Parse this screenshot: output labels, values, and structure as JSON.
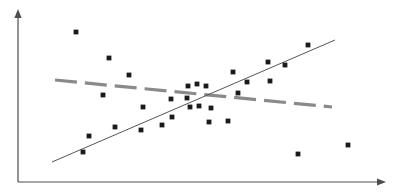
{
  "figure": {
    "width": 399,
    "height": 195,
    "background_color": "#ffffff",
    "title": "",
    "alt_description": "Scatter plot with an upward solid regression line and a downward dashed gray line"
  },
  "colors": {
    "axis": "#4d4d4d",
    "point": "#1a1a1a",
    "solid_line": "#555555",
    "dashed_line": "#8a8a8a",
    "background": "#ffffff"
  },
  "axes": {
    "origin": {
      "x": 18,
      "y": 182
    },
    "y_axis": {
      "x": 18,
      "y_top": 13,
      "y_bottom": 182,
      "arrow": "up-arrow",
      "label": "",
      "ticks": []
    },
    "x_axis": {
      "y": 182,
      "x_left": 18,
      "x_right": 382,
      "arrow": "right-arrow",
      "label": "",
      "ticks": []
    },
    "stroke_width": 1.2,
    "arrow_size": 5
  },
  "chart_data": {
    "type": "scatter",
    "title": "",
    "xlabel": "",
    "ylabel": "",
    "xlim": [
      18,
      382
    ],
    "ylim": [
      13,
      182
    ],
    "grid": false,
    "legend": "none",
    "axis_ticks_visible": false,
    "point_marker": "square",
    "point_size": 2.4,
    "points": [
      {
        "x": 76,
        "y": 32
      },
      {
        "x": 109,
        "y": 58
      },
      {
        "x": 129,
        "y": 75
      },
      {
        "x": 103,
        "y": 95
      },
      {
        "x": 143,
        "y": 107
      },
      {
        "x": 171,
        "y": 99
      },
      {
        "x": 172,
        "y": 117
      },
      {
        "x": 115,
        "y": 127
      },
      {
        "x": 141,
        "y": 130
      },
      {
        "x": 162,
        "y": 125
      },
      {
        "x": 89,
        "y": 136
      },
      {
        "x": 83,
        "y": 152
      },
      {
        "x": 188,
        "y": 86
      },
      {
        "x": 197,
        "y": 84
      },
      {
        "x": 206,
        "y": 86
      },
      {
        "x": 187,
        "y": 98
      },
      {
        "x": 190,
        "y": 107
      },
      {
        "x": 199,
        "y": 106
      },
      {
        "x": 211,
        "y": 108
      },
      {
        "x": 209,
        "y": 122
      },
      {
        "x": 228,
        "y": 121
      },
      {
        "x": 233,
        "y": 72
      },
      {
        "x": 247,
        "y": 82
      },
      {
        "x": 238,
        "y": 93
      },
      {
        "x": 268,
        "y": 62
      },
      {
        "x": 270,
        "y": 81
      },
      {
        "x": 285,
        "y": 65
      },
      {
        "x": 308,
        "y": 45
      },
      {
        "x": 298,
        "y": 154
      },
      {
        "x": 348,
        "y": 145
      }
    ],
    "series": [
      {
        "name": "solid-trend-line",
        "type": "line",
        "style": "solid",
        "color": "#555555",
        "stroke_width": 1.0,
        "direction": "increasing",
        "start": {
          "x": 52,
          "y": 162
        },
        "end": {
          "x": 335,
          "y": 40
        }
      },
      {
        "name": "dashed-trend-line",
        "type": "line",
        "style": "dashed",
        "color": "#8a8a8a",
        "stroke_width": 3.2,
        "dash_length": 22,
        "dash_gap": 8,
        "direction": "decreasing",
        "start": {
          "x": 55,
          "y": 80
        },
        "end": {
          "x": 332,
          "y": 107
        }
      }
    ]
  }
}
